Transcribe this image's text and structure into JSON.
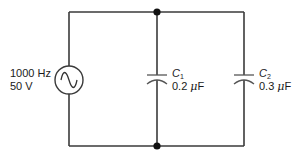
{
  "diagram": {
    "type": "circuit-schematic",
    "source": {
      "frequency_label": "1000 Hz",
      "voltage_label": "50 V",
      "symbol": "sine-wave-icon"
    },
    "capacitors": [
      {
        "name": "C",
        "subscript": "1",
        "value_num": "0.2 ",
        "unit_mu": "μ",
        "unit_f": "F"
      },
      {
        "name": "C",
        "subscript": "2",
        "value_num": "0.3 ",
        "unit_mu": "μ",
        "unit_f": "F"
      }
    ],
    "connection": "parallel",
    "junction_count": 2,
    "colors": {
      "wire": "#3a3a3a",
      "plate": "#555555",
      "text": "#1a1a1a",
      "background": "#ffffff"
    }
  }
}
